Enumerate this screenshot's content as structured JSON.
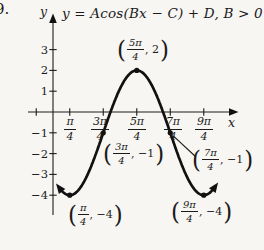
{
  "problem_number": "9.",
  "equation": "y = Acos(Bx − C) + D, B > 0",
  "axes": {
    "x_label": "x",
    "y_label": "y"
  },
  "y_tick_labels": [
    "3",
    "2",
    "1",
    "−1",
    "−2",
    "−3",
    "−4"
  ],
  "x_tick_labels": [
    {
      "num": "π",
      "den": "4"
    },
    {
      "num": "3π",
      "den": "4"
    },
    {
      "num": "5π",
      "den": "4"
    },
    {
      "num": "7π",
      "den": "4"
    },
    {
      "num": "9π",
      "den": "4"
    }
  ],
  "point_labels": [
    {
      "num": "5π",
      "den": "4",
      "val": "2",
      "text": "(5π/4, 2)"
    },
    {
      "num": "3π",
      "den": "4",
      "val": "−1",
      "text": "(3π/4, −1)"
    },
    {
      "num": "7π",
      "den": "4",
      "val": "−1",
      "text": "(7π/4, −1)"
    },
    {
      "num": "π",
      "den": "4",
      "val": "−4",
      "text": "(π/4, −4)"
    },
    {
      "num": "9π",
      "den": "4",
      "val": "−4",
      "text": "(9π/4, −4)"
    }
  ],
  "chart_data": {
    "type": "line",
    "title": "y = Acos(Bx − C) + D, B > 0",
    "function": "y = 3cos(x − 5π/4) − 1",
    "params": {
      "A": 3,
      "B": 1,
      "C_rad": 3.92699,
      "D": -1
    },
    "amplitude": 3,
    "midline": -1,
    "period_rad": 6.28319,
    "x_domain_rad": [
      0.34,
      7.55
    ],
    "x_ticks_rad": [
      -0.7854,
      0.7854,
      2.35619,
      3.92699,
      5.49779,
      7.06858
    ],
    "y_ticks": [
      3,
      2,
      1,
      -1,
      -2,
      -3,
      -4
    ],
    "ylim": [
      -4.5,
      3.5
    ],
    "grid": false,
    "key_points": [
      {
        "x": "5π/4",
        "x_rad": 3.92699,
        "y": 2,
        "role": "maximum"
      },
      {
        "x": "3π/4",
        "x_rad": 2.35619,
        "y": -1,
        "role": "midline-ascending"
      },
      {
        "x": "7π/4",
        "x_rad": 5.49779,
        "y": -1,
        "role": "midline-descending"
      },
      {
        "x": "π/4",
        "x_rad": 0.7854,
        "y": -4,
        "role": "minimum"
      },
      {
        "x": "9π/4",
        "x_rad": 7.06858,
        "y": -4,
        "role": "minimum"
      }
    ],
    "leader_line_point": "7π/4"
  }
}
